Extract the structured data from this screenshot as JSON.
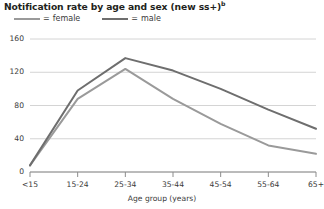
{
  "chart_data": {
    "type": "line",
    "title": "Notification rate by age and sex (new ss+)",
    "title_superscript": "b",
    "xlabel": "Age group (years)",
    "ylabel": "",
    "categories": [
      "<15",
      "15-24",
      "25-34",
      "35-44",
      "45-54",
      "55-64",
      "65+"
    ],
    "series": [
      {
        "name": "female",
        "color": "#9a9a9a",
        "values": [
          8,
          88,
          124,
          88,
          58,
          32,
          22
        ]
      },
      {
        "name": "male",
        "color": "#6e6e6e",
        "values": [
          8,
          98,
          137,
          122,
          100,
          75,
          52
        ]
      }
    ],
    "ylim": [
      0,
      160
    ],
    "yticks": [
      0,
      40,
      80,
      120,
      160
    ],
    "ytick_labels": [
      "0",
      "40",
      "80",
      "120",
      "160"
    ],
    "grid": true,
    "legend_position": "top-left",
    "legend": [
      {
        "label": "female",
        "separator": "="
      },
      {
        "label": "male",
        "separator": "="
      }
    ]
  },
  "colors": {
    "grid": "#d4d4d4",
    "axis": "#8c8c8c",
    "text": "#3a3a3a",
    "title": "#231f20"
  }
}
